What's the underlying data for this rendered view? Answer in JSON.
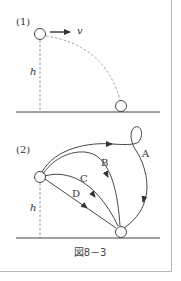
{
  "figure": {
    "caption": "図8－3",
    "part1": {
      "label": "(1)",
      "velocity_label": "v",
      "height_label": "h"
    },
    "part2": {
      "label": "(2)",
      "height_label": "h",
      "paths": [
        {
          "name": "A"
        },
        {
          "name": "B"
        },
        {
          "name": "C"
        },
        {
          "name": "D"
        }
      ]
    }
  }
}
